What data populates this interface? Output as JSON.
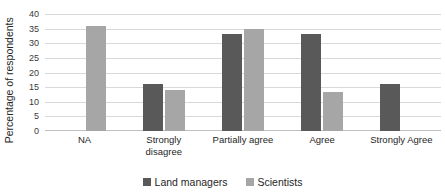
{
  "chart_data": {
    "type": "bar",
    "title": "",
    "subtitle": "",
    "xlabel": "",
    "ylabel": "Percentage of respondents",
    "ylim": [
      0,
      40
    ],
    "ytick_step": 5,
    "yticks": [
      "0",
      "5",
      "10",
      "15",
      "20",
      "25",
      "30",
      "35",
      "40"
    ],
    "grid": "horizontal",
    "legend_position": "bottom-center",
    "categories": [
      "NA",
      "Strongly disagree",
      "Partially agree",
      "Agree",
      "Strongly Agree"
    ],
    "category_lines": [
      [
        "NA"
      ],
      [
        "Strongly",
        "disagree"
      ],
      [
        "Partially agree"
      ],
      [
        "Agree"
      ],
      [
        "Strongly Agree"
      ]
    ],
    "series": [
      {
        "name": "Land managers",
        "color": "#595959",
        "values": [
          0,
          16,
          33,
          33,
          16
        ]
      },
      {
        "name": "Scientists",
        "color": "#a6a6a6",
        "values": [
          36,
          14,
          35,
          13.5,
          0
        ]
      }
    ],
    "colors": {
      "gridline": "#d9d9d9",
      "axis": "#bfbfbf",
      "text": "#262626",
      "background": "#ffffff"
    }
  }
}
